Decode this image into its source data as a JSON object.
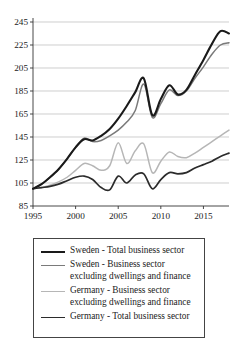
{
  "chart_data": {
    "type": "line",
    "title": "",
    "xlabel": "",
    "ylabel": "",
    "xlim": [
      1995,
      2018
    ],
    "ylim": [
      85,
      245
    ],
    "grid": true,
    "xticks": [
      1995,
      2000,
      2005,
      2010,
      2015
    ],
    "yticks": [
      85,
      105,
      125,
      145,
      165,
      185,
      205,
      225,
      245
    ],
    "legend_position": "below",
    "x": [
      1995,
      1996,
      1997,
      1998,
      1999,
      2000,
      2001,
      2002,
      2003,
      2004,
      2005,
      2006,
      2007,
      2008,
      2009,
      2010,
      2011,
      2012,
      2013,
      2014,
      2015,
      2016,
      2017,
      2018
    ],
    "series": [
      {
        "name": "Sweden - Total business sector",
        "color": "#1a1a1a",
        "width": 2.1,
        "values": [
          100,
          104,
          110,
          117,
          126,
          136,
          143,
          142,
          146,
          152,
          161,
          172,
          184,
          196,
          164,
          178,
          190,
          182,
          186,
          199,
          212,
          226,
          237,
          235
        ]
      },
      {
        "name": "Sweden - Business sector excluding dwellings and finance",
        "color": "#7a7a7a",
        "width": 1.5,
        "values": [
          100,
          104,
          110,
          117,
          126,
          136,
          144,
          141,
          142,
          146,
          151,
          158,
          168,
          191,
          162,
          174,
          186,
          181,
          185,
          196,
          206,
          217,
          225,
          227
        ]
      },
      {
        "name": "Germany - Business sector excluding dwellings and finance",
        "color": "#b6b6b6",
        "width": 1.5,
        "values": [
          100,
          101,
          103,
          106,
          110,
          116,
          122,
          120,
          116,
          120,
          140,
          122,
          133,
          139,
          114,
          124,
          132,
          128,
          127,
          131,
          136,
          141,
          146,
          151
        ]
      },
      {
        "name": "Germany - Total business sector",
        "color": "#2b2b2b",
        "width": 1.7,
        "values": [
          100,
          101,
          102,
          104,
          107,
          110,
          111,
          108,
          101,
          99,
          111,
          105,
          112,
          113,
          100,
          108,
          114,
          113,
          114,
          118,
          121,
          124,
          128,
          131
        ]
      }
    ]
  },
  "legend": {
    "items": [
      {
        "label": "Sweden - Total business sector"
      },
      {
        "label": "Sweden - Business sector excluding dwellings and finance"
      },
      {
        "label": "Germany - Business sector excluding dwellings and finance"
      },
      {
        "label": "Germany - Total business sector"
      }
    ]
  }
}
